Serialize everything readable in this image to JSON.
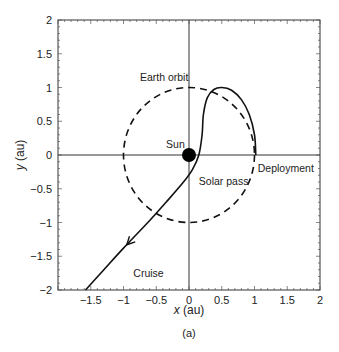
{
  "chart_data": {
    "type": "line",
    "title": "",
    "caption": "(a)",
    "xlabel": "x (au)",
    "ylabel": "y (au)",
    "xlim": [
      -2,
      2
    ],
    "ylim": [
      -2,
      2
    ],
    "x_ticks": [
      "-1.5",
      "-1",
      "-0.5",
      "0",
      "0.5",
      "1",
      "1.5",
      "2"
    ],
    "y_ticks": [
      "-2",
      "-1.5",
      "-1",
      "-0.5",
      "0",
      "0.5",
      "1",
      "1.5",
      "2"
    ],
    "grid": false,
    "axes_lines_through_origin": true,
    "series": [
      {
        "name": "Earth orbit",
        "style": "dashed",
        "shape": "circle",
        "center": [
          0,
          0
        ],
        "radius": 1.0
      },
      {
        "name": "Trajectory",
        "style": "solid",
        "points": [
          [
            1.02,
            0.0
          ],
          [
            1.0,
            0.3
          ],
          [
            0.92,
            0.6
          ],
          [
            0.8,
            0.82
          ],
          [
            0.65,
            0.96
          ],
          [
            0.5,
            1.0
          ],
          [
            0.38,
            0.97
          ],
          [
            0.28,
            0.85
          ],
          [
            0.22,
            0.6
          ],
          [
            0.2,
            0.3
          ],
          [
            0.15,
            0.0
          ],
          [
            0.05,
            -0.22
          ],
          [
            -0.1,
            -0.42
          ],
          [
            -0.35,
            -0.7
          ],
          [
            -0.6,
            -0.97
          ],
          [
            -1.0,
            -1.38
          ],
          [
            -1.3,
            -1.7
          ],
          [
            -1.58,
            -2.0
          ]
        ],
        "arrow_at": [
          -0.95,
          -1.33
        ],
        "arrow_direction": "down-left"
      }
    ],
    "markers": [
      {
        "name": "Sun",
        "x": 0,
        "y": 0,
        "shape": "filled-circle"
      }
    ],
    "annotations": [
      {
        "text": "Earth orbit",
        "x": -0.75,
        "y": 1.1
      },
      {
        "text": "Sun",
        "x": -0.35,
        "y": 0.1
      },
      {
        "text": "Deployment",
        "x": 1.05,
        "y": -0.25
      },
      {
        "text": "Solar pass",
        "x": 0.15,
        "y": -0.45
      },
      {
        "text": "Cruise",
        "x": -0.85,
        "y": -1.8
      }
    ]
  }
}
